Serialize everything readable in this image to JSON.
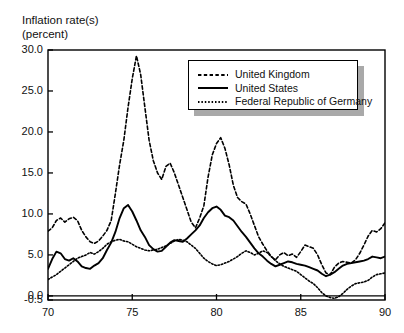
{
  "chart_data": {
    "type": "line",
    "title": "Inflation rate(s)\n(percent)",
    "ylabel": "Inflation rate(s) (percent)",
    "xlabel": "",
    "xlim": [
      70,
      90
    ],
    "ylim": [
      -0.5,
      30.0
    ],
    "grid": false,
    "legend_position": "top-right",
    "ytick_labels": [
      "30.0",
      "25.0",
      "20.0",
      "15.0",
      "10.0",
      "5.0",
      "0.0",
      "-0.5"
    ],
    "yticks": [
      30.0,
      25.0,
      20.0,
      15.0,
      10.0,
      5.0,
      0.0,
      -0.5
    ],
    "xtick_labels": [
      "70",
      "75",
      "80",
      "85",
      "90"
    ],
    "xticks": [
      70,
      75,
      80,
      85,
      90
    ],
    "zero_line": 0.0,
    "series": [
      {
        "name": "United Kingdom",
        "style": "dashed",
        "x": [
          70.0,
          70.25,
          70.5,
          70.75,
          71.0,
          71.25,
          71.5,
          71.75,
          72.0,
          72.25,
          72.5,
          72.75,
          73.0,
          73.25,
          73.5,
          73.75,
          74.0,
          74.25,
          74.5,
          74.75,
          75.0,
          75.25,
          75.5,
          75.75,
          76.0,
          76.25,
          76.5,
          76.75,
          77.0,
          77.25,
          77.5,
          77.75,
          78.0,
          78.25,
          78.5,
          78.75,
          79.0,
          79.25,
          79.5,
          79.75,
          80.0,
          80.25,
          80.5,
          80.75,
          81.0,
          81.25,
          81.5,
          81.75,
          82.0,
          82.25,
          82.5,
          82.75,
          83.0,
          83.25,
          83.5,
          83.75,
          84.0,
          84.25,
          84.5,
          84.75,
          85.0,
          85.25,
          85.5,
          85.75,
          86.0,
          86.25,
          86.5,
          86.75,
          87.0,
          87.25,
          87.5,
          87.75,
          88.0,
          88.25,
          88.5,
          88.75,
          89.0,
          89.25,
          89.5,
          89.75,
          90.0
        ],
        "y": [
          7.9,
          8.3,
          9.2,
          9.5,
          9.0,
          9.4,
          9.6,
          9.2,
          8.0,
          7.2,
          6.6,
          6.4,
          6.7,
          7.3,
          8.0,
          9.2,
          12.5,
          16.0,
          19.0,
          23.0,
          26.5,
          29.3,
          27.0,
          23.0,
          19.0,
          16.5,
          15.0,
          14.2,
          15.8,
          16.2,
          15.0,
          13.5,
          12.0,
          10.5,
          9.0,
          8.3,
          9.5,
          11.0,
          14.5,
          17.2,
          18.6,
          19.3,
          18.0,
          16.0,
          13.5,
          12.0,
          11.5,
          11.2,
          10.0,
          8.6,
          7.2,
          6.3,
          5.5,
          4.8,
          4.4,
          5.0,
          5.3,
          4.9,
          5.1,
          4.7,
          5.4,
          6.2,
          6.0,
          5.8,
          5.0,
          3.8,
          2.8,
          2.6,
          3.5,
          4.0,
          4.2,
          4.1,
          4.0,
          4.4,
          5.2,
          6.2,
          7.3,
          8.0,
          7.8,
          8.2,
          8.9
        ]
      },
      {
        "name": "United States",
        "style": "solid",
        "x": [
          70.0,
          70.25,
          70.5,
          70.75,
          71.0,
          71.25,
          71.5,
          71.75,
          72.0,
          72.25,
          72.5,
          72.75,
          73.0,
          73.25,
          73.5,
          73.75,
          74.0,
          74.25,
          74.5,
          74.75,
          75.0,
          75.25,
          75.5,
          75.75,
          76.0,
          76.25,
          76.5,
          76.75,
          77.0,
          77.25,
          77.5,
          77.75,
          78.0,
          78.25,
          78.5,
          78.75,
          79.0,
          79.25,
          79.5,
          79.75,
          80.0,
          80.25,
          80.5,
          80.75,
          81.0,
          81.25,
          81.5,
          81.75,
          82.0,
          82.25,
          82.5,
          82.75,
          83.0,
          83.25,
          83.5,
          83.75,
          84.0,
          84.25,
          84.5,
          84.75,
          85.0,
          85.25,
          85.5,
          85.75,
          86.0,
          86.25,
          86.5,
          86.75,
          87.0,
          87.25,
          87.5,
          87.75,
          88.0,
          88.25,
          88.5,
          88.75,
          89.0,
          89.25,
          89.5,
          89.75,
          90.0
        ],
        "y": [
          3.3,
          4.5,
          5.4,
          5.2,
          4.5,
          4.3,
          4.6,
          4.2,
          3.6,
          3.4,
          3.3,
          3.7,
          4.0,
          4.6,
          5.6,
          6.5,
          7.8,
          9.5,
          10.7,
          11.1,
          10.3,
          9.2,
          8.0,
          7.2,
          6.2,
          5.7,
          5.4,
          5.5,
          6.0,
          6.5,
          6.8,
          6.7,
          6.6,
          7.0,
          7.5,
          8.0,
          8.6,
          9.5,
          10.2,
          10.7,
          10.9,
          10.5,
          9.8,
          9.6,
          9.2,
          8.5,
          7.8,
          7.2,
          6.5,
          5.8,
          5.2,
          4.8,
          4.3,
          3.9,
          3.6,
          3.8,
          4.0,
          4.2,
          4.1,
          3.9,
          3.8,
          3.7,
          3.5,
          3.3,
          3.1,
          2.7,
          2.4,
          2.6,
          2.9,
          3.3,
          3.7,
          3.9,
          4.0,
          4.1,
          4.2,
          4.3,
          4.5,
          4.8,
          4.7,
          4.6,
          4.8
        ]
      },
      {
        "name": "Federal Republic of Germany",
        "style": "dotted",
        "x": [
          70.0,
          70.25,
          70.5,
          70.75,
          71.0,
          71.25,
          71.5,
          71.75,
          72.0,
          72.25,
          72.5,
          72.75,
          73.0,
          73.25,
          73.5,
          73.75,
          74.0,
          74.25,
          74.5,
          74.75,
          75.0,
          75.25,
          75.5,
          75.75,
          76.0,
          76.25,
          76.5,
          76.75,
          77.0,
          77.25,
          77.5,
          77.75,
          78.0,
          78.25,
          78.5,
          78.75,
          79.0,
          79.25,
          79.5,
          79.75,
          80.0,
          80.25,
          80.5,
          80.75,
          81.0,
          81.25,
          81.5,
          81.75,
          82.0,
          82.25,
          82.5,
          82.75,
          83.0,
          83.25,
          83.5,
          83.75,
          84.0,
          84.25,
          84.5,
          84.75,
          85.0,
          85.25,
          85.5,
          85.75,
          86.0,
          86.25,
          86.5,
          86.75,
          87.0,
          87.25,
          87.5,
          87.75,
          88.0,
          88.25,
          88.5,
          88.75,
          89.0,
          89.25,
          89.5,
          89.75,
          90.0
        ],
        "y": [
          2.0,
          2.3,
          2.6,
          3.0,
          3.4,
          3.8,
          4.2,
          4.6,
          4.8,
          5.0,
          5.3,
          5.1,
          5.4,
          5.8,
          6.3,
          6.6,
          6.8,
          6.9,
          6.7,
          6.6,
          6.3,
          6.0,
          5.8,
          5.6,
          5.5,
          5.6,
          5.7,
          5.9,
          6.1,
          6.4,
          6.7,
          6.9,
          6.8,
          6.6,
          6.2,
          5.8,
          5.2,
          4.6,
          4.2,
          3.9,
          3.7,
          3.8,
          4.0,
          4.2,
          4.5,
          4.8,
          5.2,
          5.5,
          5.3,
          5.0,
          5.2,
          5.5,
          5.3,
          4.8,
          4.3,
          3.9,
          3.6,
          3.4,
          3.2,
          3.0,
          2.6,
          2.2,
          1.8,
          1.5,
          1.0,
          0.4,
          0.0,
          -0.2,
          -0.3,
          -0.1,
          0.3,
          0.8,
          1.2,
          1.5,
          1.6,
          1.7,
          1.9,
          2.3,
          2.6,
          2.7,
          2.8
        ]
      }
    ]
  }
}
